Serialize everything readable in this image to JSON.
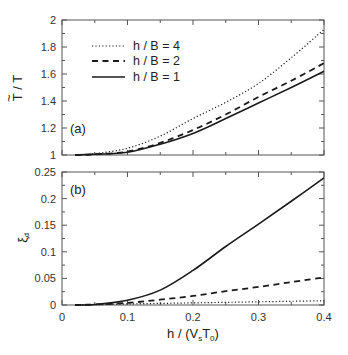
{
  "chart_data": [
    {
      "type": "line",
      "panel_label": "(a)",
      "title": "",
      "xlabel": "",
      "ylabel": "T̃ / T",
      "ylabel_main": "T",
      "ylabel_tilde": "~",
      "ylabel_rest": " / T",
      "xlim": [
        0,
        0.4
      ],
      "ylim": [
        1,
        2
      ],
      "xticks": [
        0,
        0.1,
        0.2,
        0.3,
        0.4
      ],
      "yticks": [
        1,
        1.2,
        1.4,
        1.6,
        1.8,
        2
      ],
      "ytick_labels": [
        "1",
        "1.2",
        "1.4",
        "1.6",
        "1.8",
        "2"
      ],
      "grid": false,
      "legend_position": "upper left",
      "x": [
        0.02,
        0.05,
        0.1,
        0.15,
        0.2,
        0.25,
        0.3,
        0.35,
        0.4
      ],
      "series": [
        {
          "name": "h / B = 4",
          "style": "dotted",
          "values": [
            1.0,
            1.01,
            1.05,
            1.14,
            1.27,
            1.39,
            1.53,
            1.72,
            1.93
          ]
        },
        {
          "name": "h / B = 2",
          "style": "dashed",
          "values": [
            1.0,
            1.005,
            1.025,
            1.09,
            1.185,
            1.3,
            1.43,
            1.55,
            1.68
          ]
        },
        {
          "name": "h / B = 1",
          "style": "solid",
          "values": [
            1.0,
            1.005,
            1.02,
            1.08,
            1.16,
            1.27,
            1.385,
            1.5,
            1.62
          ]
        }
      ]
    },
    {
      "type": "line",
      "panel_label": "(b)",
      "title": "",
      "xlabel": "h / (V_s T_0)",
      "ylabel": "ξ_d",
      "xlim": [
        0,
        0.4
      ],
      "ylim": [
        0,
        0.25
      ],
      "xticks": [
        0,
        0.1,
        0.2,
        0.3,
        0.4
      ],
      "xtick_labels": [
        "0",
        "0.1",
        "0.2",
        "0.3",
        "0.4"
      ],
      "yticks": [
        0,
        0.05,
        0.1,
        0.15,
        0.2,
        0.25
      ],
      "ytick_labels": [
        "0",
        "0.05",
        "0.1",
        "0.15",
        "0.2",
        "0.25"
      ],
      "grid": false,
      "x": [
        0.02,
        0.05,
        0.1,
        0.15,
        0.2,
        0.25,
        0.3,
        0.35,
        0.4
      ],
      "series": [
        {
          "name": "h / B = 4",
          "style": "dotted",
          "values": [
            0.0,
            0.0005,
            0.002,
            0.003,
            0.004,
            0.005,
            0.006,
            0.007,
            0.008
          ]
        },
        {
          "name": "h / B = 2",
          "style": "dashed",
          "values": [
            0.0,
            0.001,
            0.004,
            0.01,
            0.017,
            0.026,
            0.034,
            0.043,
            0.052
          ]
        },
        {
          "name": "h / B = 1",
          "style": "solid",
          "values": [
            0.0,
            0.001,
            0.009,
            0.028,
            0.065,
            0.11,
            0.152,
            0.195,
            0.239
          ]
        }
      ]
    }
  ],
  "labels": {
    "xlabel_prefix": "h / (V",
    "xlabel_sub1": "s",
    "xlabel_mid": "T",
    "xlabel_sub2": "0",
    "xlabel_suffix": ")",
    "b_ylabel_main": "ξ",
    "b_ylabel_sub": "d"
  },
  "colors": {
    "line": "#1a1a1a",
    "frame": "#555555",
    "text": "#222222"
  }
}
